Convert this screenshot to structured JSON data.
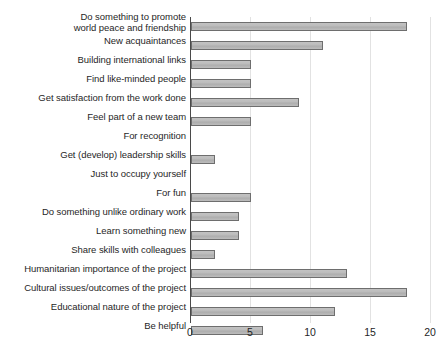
{
  "chart_data": {
    "type": "bar",
    "orientation": "horizontal",
    "title": "",
    "subtitle": "",
    "xlabel": "",
    "ylabel": "",
    "xlim": [
      0,
      20
    ],
    "xticks": [
      0,
      5,
      10,
      15,
      20
    ],
    "xtick_labels": [
      "0",
      "5",
      "10",
      "15",
      "20"
    ],
    "grid": true,
    "grid_axis": "x",
    "legend": false,
    "legend_position": "none",
    "bar_fill_color": "#b5b5b5",
    "bar_edge_color": "#6e6e6e",
    "grid_color": "#e2e2e2",
    "axis_color": "#4a4a4a",
    "categories": [
      "Do something to promote\nworld peace and friendship",
      "New acquaintances",
      "Building international links",
      "Find like-minded people",
      "Get satisfaction from the work done",
      "Feel part of a new team",
      "For recognition",
      "Get (develop) leadership skills",
      "Just to occupy yourself",
      "For fun",
      "Do something unlike ordinary work",
      "Learn something new",
      "Share skills with colleagues",
      "Humanitarian importance of the project",
      "Cultural issues/outcomes of the project",
      "Educational nature of the project",
      "Be helpful"
    ],
    "values": [
      18,
      11,
      5,
      5,
      9,
      5,
      0,
      2,
      0,
      5,
      4,
      4,
      2,
      13,
      18,
      12,
      6
    ]
  }
}
